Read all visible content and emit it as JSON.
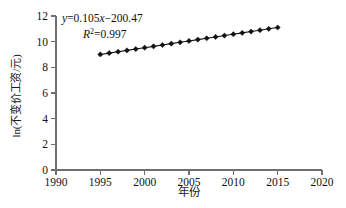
{
  "chart_data": {
    "type": "line",
    "title": "",
    "xlabel": "年份",
    "ylabel": "ln(不变价工资/元)",
    "xlim": [
      1990,
      2020
    ],
    "ylim": [
      0,
      12
    ],
    "xticks": [
      1990,
      1995,
      2000,
      2005,
      2010,
      2015,
      2020
    ],
    "yticks": [
      0,
      2,
      4,
      6,
      8,
      10,
      12
    ],
    "grid": false,
    "legend": "none",
    "marker": "diamond",
    "marker_color": "#111111",
    "line_color": "#111111",
    "x": [
      1995,
      1996,
      1997,
      1998,
      1999,
      2000,
      2001,
      2002,
      2003,
      2004,
      2005,
      2006,
      2007,
      2008,
      2009,
      2010,
      2011,
      2012,
      2013,
      2014,
      2015
    ],
    "values": [
      9.005,
      9.11,
      9.215,
      9.32,
      9.425,
      9.53,
      9.635,
      9.74,
      9.845,
      9.95,
      10.055,
      10.16,
      10.265,
      10.37,
      10.475,
      10.58,
      10.685,
      10.79,
      10.895,
      11.0,
      11.105
    ],
    "series": [
      {
        "name": "ln(不变价工资/元)",
        "values": [
          9.005,
          9.11,
          9.215,
          9.32,
          9.425,
          9.53,
          9.635,
          9.74,
          9.845,
          9.95,
          10.055,
          10.16,
          10.265,
          10.37,
          10.475,
          10.58,
          10.685,
          10.79,
          10.895,
          11.0,
          11.105
        ]
      }
    ],
    "annotations": {
      "equation_y": "y",
      "equation_rest": "=0.105",
      "equation_x": "x",
      "equation_tail": "−200.47",
      "equation_full": "y=0.105x−200.47",
      "r_squared_symbol": "R",
      "r_squared_exponent": "2",
      "r_squared_value": "=0.997",
      "r_squared_full": "R2=0.997",
      "slope": 0.105,
      "intercept": -200.47,
      "r2": 0.997
    }
  },
  "axis": {
    "ytick_labels": [
      "0",
      "2",
      "4",
      "6",
      "8",
      "10",
      "12"
    ],
    "xtick_labels": [
      "1990",
      "1995",
      "2000",
      "2005",
      "2010",
      "2015",
      "2020"
    ]
  }
}
